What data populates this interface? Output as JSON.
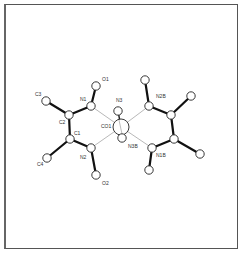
{
  "figure": {
    "type": "molecular-structure"
  },
  "atoms": [
    {
      "id": "C3",
      "label": "C3",
      "x": 46,
      "y": 101,
      "r": 4.2,
      "lx": 35,
      "ly": 96
    },
    {
      "id": "N1",
      "label": "N1",
      "x": 91,
      "y": 106,
      "r": 4.2,
      "lx": 80,
      "ly": 101
    },
    {
      "id": "O1",
      "label": "O1",
      "x": 96,
      "y": 86,
      "r": 4.2,
      "lx": 102,
      "ly": 81
    },
    {
      "id": "C2",
      "label": "C2",
      "x": 69,
      "y": 115,
      "r": 4.2,
      "lx": 59,
      "ly": 124
    },
    {
      "id": "C1",
      "label": "C1",
      "x": 70,
      "y": 139,
      "r": 4.2,
      "lx": 74,
      "ly": 135
    },
    {
      "id": "C4",
      "label": "C4",
      "x": 47,
      "y": 158,
      "r": 4.2,
      "lx": 37,
      "ly": 166
    },
    {
      "id": "N2",
      "label": "N2",
      "x": 91,
      "y": 148,
      "r": 4.2,
      "lx": 80,
      "ly": 159
    },
    {
      "id": "O2",
      "label": "O2",
      "x": 96,
      "y": 175,
      "r": 4.2,
      "lx": 102,
      "ly": 185
    },
    {
      "id": "Co1",
      "label": "CO1",
      "x": 121,
      "y": 127,
      "r": 8.0,
      "lx": 101,
      "ly": 128
    },
    {
      "id": "N3",
      "label": "N3",
      "x": 118,
      "y": 111,
      "r": 4.2,
      "lx": 116,
      "ly": 102
    },
    {
      "id": "N3B",
      "label": "N3B",
      "x": 122,
      "y": 138,
      "r": 4.2,
      "lx": 128,
      "ly": 148
    },
    {
      "id": "N2B",
      "label": "N2B",
      "x": 149,
      "y": 106,
      "r": 4.2,
      "lx": 156,
      "ly": 98
    },
    {
      "id": "O2B",
      "label": "",
      "x": 145,
      "y": 80,
      "r": 4.2,
      "lx": 0,
      "ly": 0
    },
    {
      "id": "C2B",
      "label": "",
      "x": 171,
      "y": 115,
      "r": 4.2,
      "lx": 0,
      "ly": 0
    },
    {
      "id": "C4B",
      "label": "",
      "x": 191,
      "y": 96,
      "r": 4.2,
      "lx": 0,
      "ly": 0
    },
    {
      "id": "C1B",
      "label": "",
      "x": 174,
      "y": 139,
      "r": 4.2,
      "lx": 0,
      "ly": 0
    },
    {
      "id": "C3B",
      "label": "",
      "x": 200,
      "y": 154,
      "r": 4.2,
      "lx": 0,
      "ly": 0
    },
    {
      "id": "N1B",
      "label": "N1B",
      "x": 152,
      "y": 148,
      "r": 4.2,
      "lx": 156,
      "ly": 157
    },
    {
      "id": "O1B",
      "label": "",
      "x": 149,
      "y": 170,
      "r": 4.2,
      "lx": 0,
      "ly": 0
    }
  ],
  "bonds": [
    {
      "a": "C3",
      "b": "C2",
      "style": "thick"
    },
    {
      "a": "C2",
      "b": "N1",
      "style": "thick"
    },
    {
      "a": "N1",
      "b": "O1",
      "style": "thick"
    },
    {
      "a": "C2",
      "b": "C1",
      "style": "thick"
    },
    {
      "a": "C1",
      "b": "C4",
      "style": "thick"
    },
    {
      "a": "C1",
      "b": "N2",
      "style": "thick"
    },
    {
      "a": "N2",
      "b": "O2",
      "style": "thick"
    },
    {
      "a": "N1",
      "b": "Co1",
      "style": "thin"
    },
    {
      "a": "N2",
      "b": "Co1",
      "style": "thin"
    },
    {
      "a": "N2B",
      "b": "Co1",
      "style": "thin"
    },
    {
      "a": "N1B",
      "b": "Co1",
      "style": "thin"
    },
    {
      "a": "N3",
      "b": "Co1",
      "style": "med"
    },
    {
      "a": "N3B",
      "b": "Co1",
      "style": "med"
    },
    {
      "a": "O2B",
      "b": "N2B",
      "style": "thick"
    },
    {
      "a": "N2B",
      "b": "C2B",
      "style": "thick"
    },
    {
      "a": "C2B",
      "b": "C4B",
      "style": "thick"
    },
    {
      "a": "C2B",
      "b": "C1B",
      "style": "thick"
    },
    {
      "a": "C1B",
      "b": "C3B",
      "style": "thick"
    },
    {
      "a": "C1B",
      "b": "N1B",
      "style": "thick"
    },
    {
      "a": "N1B",
      "b": "O1B",
      "style": "thick"
    }
  ]
}
